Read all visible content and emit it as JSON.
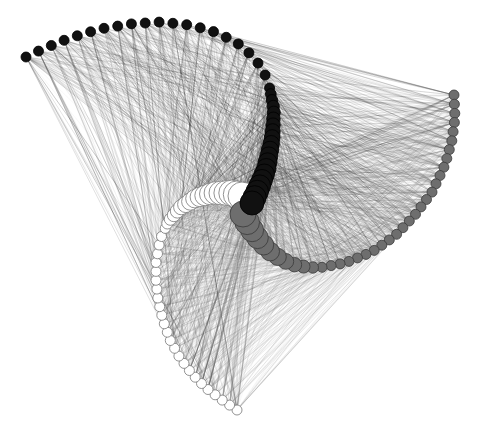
{
  "figure": {
    "type": "network-graph",
    "layout": "three-arc spiral (hive-like)",
    "width": 479,
    "height": 436,
    "background": "#ffffff"
  },
  "groups": [
    {
      "name": "black",
      "fill": "#111111",
      "stroke": "#000000",
      "edge_color": "#000000",
      "edge_opacity": 0.18,
      "outer_path": [
        [
          26,
          57
        ],
        [
          45,
          48
        ],
        [
          70,
          38
        ],
        [
          100,
          29
        ],
        [
          130,
          24
        ],
        [
          160,
          22
        ],
        [
          190,
          25
        ],
        [
          215,
          32
        ],
        [
          236,
          42
        ],
        [
          255,
          58
        ],
        [
          268,
          80
        ],
        [
          274,
          110
        ],
        [
          272,
          140
        ],
        [
          266,
          170
        ],
        [
          258,
          190
        ],
        [
          252,
          203
        ]
      ],
      "radius_start": 5,
      "radius_end": 12,
      "node_count": 40,
      "dense_from": 21
    },
    {
      "name": "gray",
      "fill": "#6e6e6e",
      "stroke": "#3a3a3a",
      "edge_color": "#555555",
      "edge_opacity": 0.14,
      "outer_path": [
        [
          454,
          95
        ],
        [
          455,
          118
        ],
        [
          452,
          140
        ],
        [
          445,
          165
        ],
        [
          432,
          192
        ],
        [
          415,
          215
        ],
        [
          395,
          236
        ],
        [
          372,
          252
        ],
        [
          345,
          263
        ],
        [
          318,
          268
        ],
        [
          298,
          266
        ],
        [
          282,
          260
        ],
        [
          268,
          250
        ],
        [
          256,
          236
        ],
        [
          248,
          224
        ],
        [
          243,
          214
        ]
      ],
      "radius_start": 5,
      "radius_end": 13,
      "node_count": 38,
      "dense_from": 27
    },
    {
      "name": "white",
      "fill": "#ffffff",
      "stroke": "#777777",
      "edge_color": "#9a9a9a",
      "edge_opacity": 0.12,
      "outer_path": [
        [
          237,
          410
        ],
        [
          222,
          400
        ],
        [
          206,
          388
        ],
        [
          192,
          374
        ],
        [
          180,
          358
        ],
        [
          170,
          340
        ],
        [
          163,
          320
        ],
        [
          158,
          300
        ],
        [
          156,
          280
        ],
        [
          156,
          262
        ],
        [
          160,
          240
        ],
        [
          168,
          222
        ],
        [
          180,
          208
        ],
        [
          196,
          198
        ],
        [
          214,
          193
        ],
        [
          232,
          193
        ],
        [
          242,
          196
        ]
      ],
      "radius_start": 5,
      "radius_end": 14,
      "node_count": 42,
      "dense_from": 25,
      "reverse_size": true
    }
  ]
}
